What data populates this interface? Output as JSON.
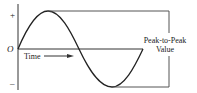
{
  "diagram": {
    "type": "sine-wave-peak-to-peak",
    "axis_labels": {
      "positive": "+",
      "origin": "O",
      "negative": "–"
    },
    "time_label": "Time",
    "annotation": {
      "line1": "Peak-to-Peak",
      "line2": "Value"
    },
    "colors": {
      "stroke": "#333333",
      "text": "#222222",
      "background": "#ffffff"
    }
  }
}
